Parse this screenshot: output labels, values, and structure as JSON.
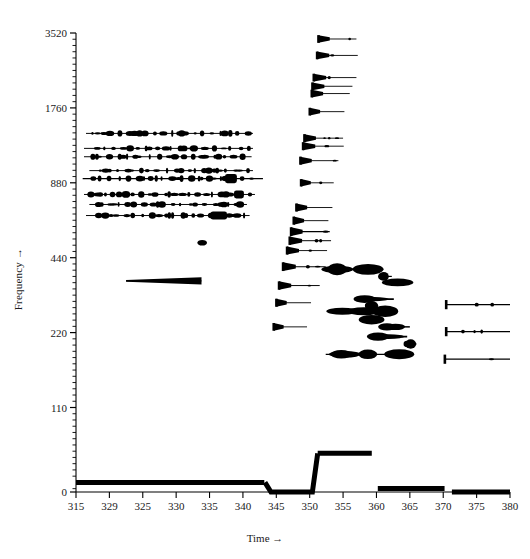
{
  "axes": {
    "y_title": "Frequency →",
    "x_title": "Time →",
    "y_ticks": [
      {
        "value": 3520,
        "label": "3520"
      },
      {
        "value": 1760,
        "label": "1760"
      },
      {
        "value": 880,
        "label": "880"
      },
      {
        "value": 440,
        "label": "440"
      },
      {
        "value": 220,
        "label": "220"
      },
      {
        "value": 110,
        "label": "110"
      },
      {
        "value": 0,
        "label": "0"
      }
    ],
    "x_ticks": [
      {
        "value": 315,
        "label": "315"
      },
      {
        "value": 320,
        "label": "329"
      },
      {
        "value": 325,
        "label": "325"
      },
      {
        "value": 330,
        "label": "330"
      },
      {
        "value": 335,
        "label": "335"
      },
      {
        "value": 340,
        "label": "340"
      },
      {
        "value": 345,
        "label": "345"
      },
      {
        "value": 350,
        "label": "350"
      },
      {
        "value": 355,
        "label": "355"
      },
      {
        "value": 360,
        "label": "360"
      },
      {
        "value": 365,
        "label": "365"
      },
      {
        "value": 370,
        "label": "370"
      },
      {
        "value": 375,
        "label": "375"
      },
      {
        "value": 380,
        "label": "380"
      }
    ],
    "ink_color": "#000000",
    "background_color": "#ffffff"
  },
  "chart_data": {
    "type": "line",
    "title": "",
    "xlabel": "Time →",
    "ylabel": "Frequency →",
    "xlim": [
      315,
      380
    ],
    "ylim": [
      0,
      3520
    ],
    "yscale": "log-octave",
    "ytick_values": [
      0,
      110,
      220,
      440,
      880,
      1760,
      3520
    ],
    "xtick_values": [
      315,
      320,
      325,
      330,
      335,
      340,
      345,
      350,
      355,
      360,
      365,
      370,
      375,
      380
    ],
    "grid": false,
    "legend": null,
    "tracks": [
      {
        "name": "f0-contour",
        "freq": 55,
        "t_start": 315.0,
        "t_end": 343.2,
        "weight": 5.0,
        "points": [
          [
            315.0,
            55
          ],
          [
            343.2,
            55
          ]
        ]
      },
      {
        "name": "f0-contour-dip",
        "freq": 28,
        "t_start": 343.5,
        "t_end": 350.8,
        "weight": 5.0,
        "points": [
          [
            343.3,
            55
          ],
          [
            344.2,
            28
          ],
          [
            350.4,
            28
          ],
          [
            351.2,
            72
          ]
        ]
      },
      {
        "name": "f0-contour-high",
        "freq": 72,
        "t_start": 351.2,
        "t_end": 359.3,
        "weight": 5.0,
        "points": [
          [
            351.2,
            72
          ],
          [
            359.3,
            72
          ]
        ]
      },
      {
        "name": "f0-contour-mid",
        "freq": 52,
        "t_start": 360.2,
        "t_end": 370.2,
        "weight": 5.0,
        "points": [
          [
            360.2,
            52
          ],
          [
            370.2,
            52
          ]
        ]
      },
      {
        "name": "f0-contour-low",
        "freq": 8,
        "t_start": 371.3,
        "t_end": 380.0,
        "weight": 5.0,
        "points": [
          [
            371.3,
            8
          ],
          [
            380.0,
            8
          ]
        ]
      },
      {
        "name": "partial-a1",
        "freq": 1390,
        "t_start": 316.5,
        "t_end": 341.5,
        "weight": 1.3
      },
      {
        "name": "partial-a2",
        "freq": 1210,
        "t_start": 316.2,
        "t_end": 341.5,
        "weight": 1.3
      },
      {
        "name": "partial-a3",
        "freq": 1120,
        "t_start": 316.2,
        "t_end": 341.3,
        "weight": 1.3
      },
      {
        "name": "partial-a4",
        "freq": 985,
        "t_start": 317.0,
        "t_end": 341.5,
        "weight": 1.3
      },
      {
        "name": "partial-a5",
        "freq": 915,
        "t_start": 316.0,
        "t_end": 343.0,
        "weight": 1.5
      },
      {
        "name": "partial-a6",
        "freq": 790,
        "t_start": 316.2,
        "t_end": 341.8,
        "weight": 1.3
      },
      {
        "name": "partial-a7",
        "freq": 720,
        "t_start": 317.0,
        "t_end": 340.6,
        "weight": 1.3
      },
      {
        "name": "partial-a8",
        "freq": 650,
        "t_start": 316.5,
        "t_end": 341.0,
        "weight": 1.3
      },
      {
        "name": "partial-b1",
        "freq": 355,
        "t_start": 322.5,
        "t_end": 333.8,
        "weight": 1.2
      },
      {
        "name": "blob-c1",
        "freq": 505,
        "t_start": 333.2,
        "t_end": 334.6,
        "weight": 1.0
      },
      {
        "name": "partial-d1",
        "freq": 3330,
        "t_start": 351.3,
        "t_end": 357.0,
        "weight": 1.1
      },
      {
        "name": "partial-d2",
        "freq": 2860,
        "t_start": 351.1,
        "t_end": 357.2,
        "weight": 1.1
      },
      {
        "name": "partial-d3",
        "freq": 2330,
        "t_start": 350.6,
        "t_end": 357.0,
        "weight": 1.1
      },
      {
        "name": "partial-d4",
        "freq": 2150,
        "t_start": 350.4,
        "t_end": 356.4,
        "weight": 1.1
      },
      {
        "name": "partial-d5",
        "freq": 2010,
        "t_start": 350.3,
        "t_end": 356.0,
        "weight": 1.1
      },
      {
        "name": "partial-d6",
        "freq": 1700,
        "t_start": 350.0,
        "t_end": 355.2,
        "weight": 1.1
      },
      {
        "name": "partial-d7",
        "freq": 1330,
        "t_start": 349.2,
        "t_end": 355.0,
        "weight": 1.2
      },
      {
        "name": "partial-d8",
        "freq": 1235,
        "t_start": 349.0,
        "t_end": 355.1,
        "weight": 1.2
      },
      {
        "name": "partial-d9",
        "freq": 1080,
        "t_start": 348.6,
        "t_end": 354.3,
        "weight": 1.2
      },
      {
        "name": "partial-d10",
        "freq": 880,
        "t_start": 348.7,
        "t_end": 353.6,
        "weight": 1.0
      },
      {
        "name": "partial-d11",
        "freq": 700,
        "t_start": 348.0,
        "t_end": 353.4,
        "weight": 1.2
      },
      {
        "name": "partial-d12",
        "freq": 620,
        "t_start": 347.6,
        "t_end": 352.8,
        "weight": 1.2
      },
      {
        "name": "partial-d13",
        "freq": 560,
        "t_start": 347.2,
        "t_end": 353.0,
        "weight": 1.4
      },
      {
        "name": "partial-d14",
        "freq": 515,
        "t_start": 347.0,
        "t_end": 353.2,
        "weight": 1.3
      },
      {
        "name": "partial-d15",
        "freq": 470,
        "t_start": 346.6,
        "t_end": 352.6,
        "weight": 1.2
      },
      {
        "name": "partial-d16",
        "freq": 405,
        "t_start": 346.0,
        "t_end": 352.4,
        "weight": 1.4
      },
      {
        "name": "partial-d17",
        "freq": 340,
        "t_start": 345.4,
        "t_end": 351.5,
        "weight": 1.3
      },
      {
        "name": "partial-d18",
        "freq": 290,
        "t_start": 345.0,
        "t_end": 350.2,
        "weight": 1.2
      },
      {
        "name": "partial-d19",
        "freq": 232,
        "t_start": 344.6,
        "t_end": 349.6,
        "weight": 1.1
      },
      {
        "name": "partial-e1",
        "freq": 395,
        "t_start": 352.2,
        "t_end": 361.0,
        "weight": 2.0
      },
      {
        "name": "partial-e2",
        "freq": 370,
        "t_start": 360.4,
        "t_end": 362.3,
        "weight": 1.6
      },
      {
        "name": "partial-e3",
        "freq": 350,
        "t_start": 362.2,
        "t_end": 363.6,
        "weight": 1.4
      },
      {
        "name": "partial-e4",
        "freq": 300,
        "t_start": 357.0,
        "t_end": 362.6,
        "weight": 2.2
      },
      {
        "name": "partial-e5",
        "freq": 282,
        "t_start": 358.4,
        "t_end": 360.0,
        "weight": 1.4
      },
      {
        "name": "partial-e6",
        "freq": 268,
        "t_start": 352.6,
        "t_end": 363.0,
        "weight": 1.8
      },
      {
        "name": "partial-e7",
        "freq": 248,
        "t_start": 358.2,
        "t_end": 360.2,
        "weight": 1.5
      },
      {
        "name": "partial-e8",
        "freq": 232,
        "t_start": 360.6,
        "t_end": 365.0,
        "weight": 2.0
      },
      {
        "name": "partial-e9",
        "freq": 212,
        "t_start": 359.0,
        "t_end": 364.6,
        "weight": 2.3
      },
      {
        "name": "partial-e10",
        "freq": 198,
        "t_start": 364.2,
        "t_end": 366.0,
        "weight": 1.5
      },
      {
        "name": "partial-e11",
        "freq": 180,
        "t_start": 352.4,
        "t_end": 365.4,
        "weight": 1.7
      },
      {
        "name": "partial-f1",
        "freq": 285,
        "t_start": 370.4,
        "t_end": 380.0,
        "weight": 1.6
      },
      {
        "name": "partial-f2",
        "freq": 222,
        "t_start": 370.4,
        "t_end": 380.0,
        "weight": 1.6
      },
      {
        "name": "partial-f3",
        "freq": 172,
        "t_start": 370.2,
        "t_end": 380.0,
        "weight": 1.6
      }
    ]
  }
}
